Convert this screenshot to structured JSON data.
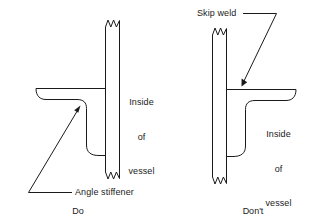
{
  "figure": {
    "title_left": "Do",
    "title_right": "Don't",
    "stroke_color": "#1a1a1a",
    "background_color": "#ffffff"
  },
  "left_panel": {
    "caption": "Do",
    "vessel_label_line1": "Inside",
    "vessel_label_line2": "of",
    "vessel_label_line3": "vessel",
    "callout_label": "Angle stiffener",
    "parts": {
      "vessel_wall": "vessel-wall",
      "angle_stiffener": "angle-stiffener",
      "break_symbol_top": "zigzag-break-top",
      "break_symbol_bottom": "zigzag-break-bottom"
    }
  },
  "right_panel": {
    "caption": "Don't",
    "vessel_label_line1": "Inside",
    "vessel_label_line2": "of",
    "vessel_label_line3": "vessel",
    "callout_label": "Skip weld",
    "parts": {
      "vessel_wall": "vessel-wall",
      "angle_stiffener": "angle-stiffener",
      "break_symbol_top": "zigzag-break-top",
      "break_symbol_bottom": "zigzag-break-bottom"
    }
  }
}
